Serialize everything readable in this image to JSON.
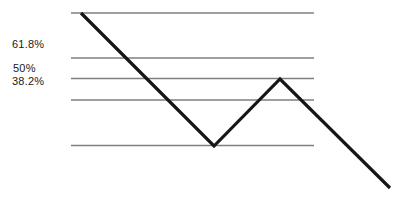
{
  "figure": {
    "width": 404,
    "height": 200,
    "background": "#ffffff"
  },
  "chart_data": {
    "type": "line",
    "retracement_levels": [
      {
        "level": "swing high (0%)",
        "label": "",
        "y_px": 13
      },
      {
        "level": "61.8%",
        "label": "61.8%",
        "y_px": 58
      },
      {
        "level": "50%",
        "label": "50%",
        "y_px": 78.5
      },
      {
        "level": "38.2%",
        "label": "38.2%",
        "y_px": 100
      },
      {
        "level": "swing low (100%)",
        "label": "",
        "y_px": 145.5
      }
    ],
    "level_line_x_px": [
      71,
      314
    ],
    "price_path_px": [
      [
        81,
        13
      ],
      [
        214,
        146
      ],
      [
        280,
        79
      ],
      [
        390,
        188
      ]
    ],
    "legend_position": "none",
    "grid": "horizontal-levels-only",
    "styles": {
      "level_line_color": "#7f7f7f",
      "level_line_width": 1.4,
      "price_line_color": "#161616",
      "price_line_width": 3.2
    }
  },
  "labels": [
    {
      "text": "61.8%",
      "x_px": 12,
      "y_px": 38
    },
    {
      "text": "50%",
      "x_px": 13,
      "y_px": 62
    },
    {
      "text": "38.2%",
      "x_px": 12,
      "y_px": 75
    }
  ]
}
